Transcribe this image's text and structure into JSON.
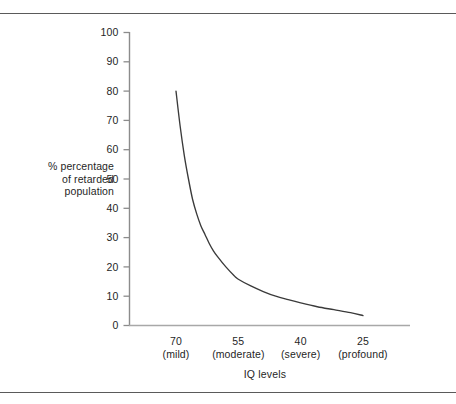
{
  "figure": {
    "background_color": "#ffffff",
    "rule_color": "#5a5a5a",
    "axis_color": "#8c8c8c",
    "curve_color": "#3a3a3a"
  },
  "chart_data": {
    "type": "line",
    "title": "",
    "subtitle": "",
    "xlabel": "IQ levels",
    "ylabel": "% percentage of retarded population",
    "ylabel_lines": [
      "% percentage",
      "of retarded",
      "population"
    ],
    "grid": false,
    "legend": false,
    "legend_position": "none",
    "xlim": [
      78,
      18
    ],
    "ylim": [
      0,
      100
    ],
    "x_axis_inverted": true,
    "yticks": [
      0,
      10,
      20,
      30,
      40,
      50,
      60,
      70,
      80,
      90,
      100
    ],
    "ytick_labels": [
      "0",
      "10",
      "20",
      "30",
      "40",
      "50",
      "60",
      "70",
      "80",
      "90",
      "100"
    ],
    "xticks": [
      70,
      55,
      40,
      25
    ],
    "xtick_labels": [
      "70",
      "55",
      "40",
      "25"
    ],
    "xtick_categories": [
      "(mild)",
      "(moderate)",
      "(severe)",
      "(profound)"
    ],
    "series": [
      {
        "name": "% of retarded population by IQ level",
        "x": [
          70,
          69,
          68,
          67,
          66,
          65,
          64,
          63,
          62,
          61,
          60,
          58,
          56,
          55,
          52,
          49,
          46,
          43,
          40,
          36,
          32,
          28,
          25
        ],
        "y": [
          80,
          68,
          58,
          50,
          43,
          38,
          34,
          31,
          28,
          25.5,
          23.5,
          20,
          17,
          15.8,
          13.5,
          11.6,
          10,
          8.8,
          7.7,
          6.4,
          5.4,
          4.4,
          3.4
        ]
      }
    ]
  },
  "annotations": []
}
